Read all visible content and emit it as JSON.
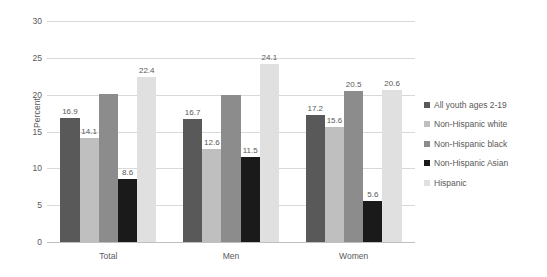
{
  "chart_data": {
    "type": "bar",
    "title": "",
    "xlabel": "",
    "ylabel": "Percent",
    "ylim": [
      0,
      30
    ],
    "ytick_step": 5,
    "yticks": [
      "30",
      "25",
      "20",
      "15",
      "10",
      "5",
      "0"
    ],
    "grid": true,
    "legend_position": "right",
    "categories": [
      "Total",
      "Men",
      "Women"
    ],
    "series": [
      {
        "name": "All youth ages 2-19",
        "color": "#595959",
        "values": [
          16.9,
          16.7,
          17.2
        ],
        "labels": [
          "16.9",
          "16.7",
          "17.2"
        ]
      },
      {
        "name": "Non-Hispanic white",
        "color": "#bfbfbf",
        "values": [
          14.1,
          12.6,
          15.6
        ],
        "labels": [
          "14.1",
          "12.6",
          "15.6"
        ]
      },
      {
        "name": "Non-Hispanic black",
        "color": "#8c8c8c",
        "values": [
          20.1,
          19.9,
          20.5
        ],
        "labels": [
          "",
          "",
          "20.5"
        ]
      },
      {
        "name": "Non-Hispanic Asian",
        "color": "#1a1a1a",
        "values": [
          8.6,
          11.5,
          5.6
        ],
        "labels": [
          "8.6",
          "11.5",
          "5.6"
        ]
      },
      {
        "name": "Hispanic",
        "color": "#e0e0e0",
        "values": [
          22.4,
          24.1,
          20.6
        ],
        "labels": [
          "22.4",
          "24.1",
          "20.6"
        ]
      }
    ]
  },
  "colors": {
    "gridline": "#d9d9d9",
    "axis": "#bfbfbf",
    "text": "#595959",
    "background": "#ffffff"
  }
}
